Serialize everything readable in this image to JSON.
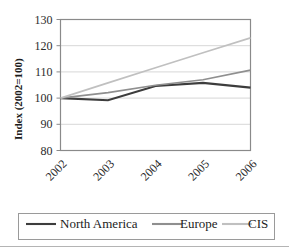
{
  "chart_data": {
    "type": "line",
    "title": "",
    "xlabel": "",
    "ylabel": "Index (2002=100)",
    "categories": [
      "2002",
      "2003",
      "2004",
      "2005",
      "2006"
    ],
    "x": [
      2002,
      2003,
      2004,
      2005,
      2006
    ],
    "ylim": [
      80,
      130
    ],
    "yticks": [
      80,
      90,
      100,
      110,
      120,
      130
    ],
    "ytick_labels": [
      "80",
      "90",
      "100",
      "110",
      "120",
      "130"
    ],
    "grid": true,
    "grid_axis": "y",
    "legend_position": "bottom",
    "series": [
      {
        "name": "North America",
        "color": "#3d3d3d",
        "width": 2.1,
        "values": [
          100,
          99.2,
          104.6,
          105.8,
          104
        ]
      },
      {
        "name": "Europe",
        "color": "#8f8f8f",
        "width": 1.7,
        "values": [
          100,
          102.1,
          104.9,
          107,
          110.7
        ]
      },
      {
        "name": "CIS",
        "color": "#c0c0c0",
        "width": 1.7,
        "values": [
          100,
          105.8,
          111.6,
          117.3,
          123
        ]
      }
    ]
  },
  "axis": {
    "y_title": "Index (2002=100)"
  },
  "legend": {
    "entries": [
      {
        "label": "North America",
        "color": "#3d3d3d"
      },
      {
        "label": "Europe",
        "color": "#8f8f8f"
      },
      {
        "label": "CIS",
        "color": "#c0c0c0"
      }
    ]
  }
}
